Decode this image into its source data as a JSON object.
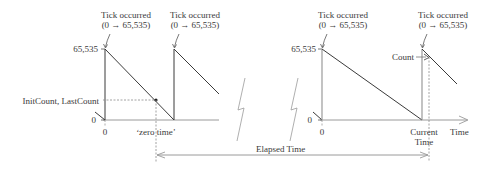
{
  "diagram": {
    "type": "timer-sawtooth",
    "left_panel": {
      "tick_labels": [
        {
          "line1": "Tick occurred",
          "line2": "(0 → 65,535)"
        },
        {
          "line1": "Tick occurred",
          "line2": "(0 → 65,535)"
        }
      ],
      "y_max_label": "65,535",
      "y_zero_label": "0",
      "init_label": "InitCount, LastCount",
      "x_zero_label": "0",
      "zero_time_label": "‘zero time’"
    },
    "right_panel": {
      "tick_labels": [
        {
          "line1": "Tick occurred",
          "line2": "(0 → 65,535)"
        },
        {
          "line1": "Tick occurred",
          "line2": "(0 → 65,535)"
        }
      ],
      "y_max_label": "65,535",
      "y_zero_label": "0",
      "count_label": "Count",
      "x_zero_label": "0",
      "current_time_line1": "Current",
      "current_time_line2": "Time",
      "x_axis_label": "Time"
    },
    "elapsed_label": "Elapsed Time",
    "colors": {
      "line": "#3a3a3a",
      "dotted": "#8a8a8a",
      "axis": "#9a9a9a"
    }
  }
}
